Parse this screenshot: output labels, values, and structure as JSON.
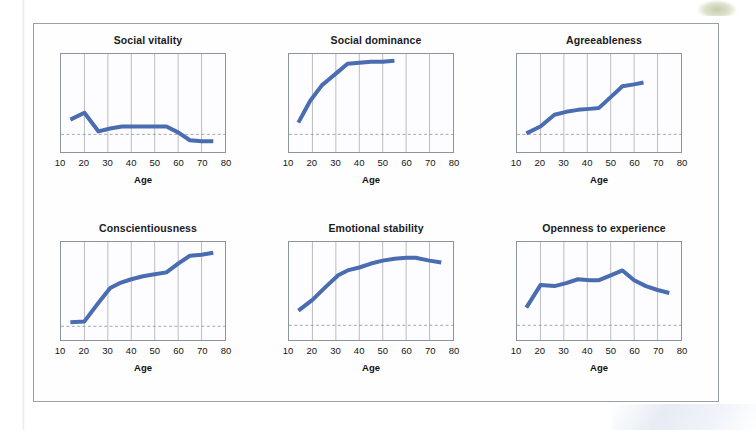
{
  "figure": {
    "x_tick_values": [
      10,
      20,
      30,
      40,
      50,
      60,
      70,
      80
    ],
    "x_axis_label": "Age",
    "line_color": "#4a6cb0",
    "reference_line_color": "#8e949b",
    "grid_color": "#9aa0a6",
    "frame_color": "#9aa0a6"
  },
  "chart_data": [
    {
      "type": "line",
      "title": "Social vitality",
      "xlabel": "Age",
      "ylabel": "",
      "xlim": [
        10,
        80
      ],
      "ylim": [
        0,
        1
      ],
      "xticks": [
        10,
        20,
        30,
        40,
        50,
        60,
        70,
        80
      ],
      "grid": "vertical",
      "reference_line_y": 0.18,
      "x": [
        14,
        20,
        26,
        31,
        36,
        41,
        46,
        51,
        55,
        60,
        65,
        70,
        75
      ],
      "y": [
        0.33,
        0.4,
        0.21,
        0.24,
        0.26,
        0.26,
        0.26,
        0.26,
        0.26,
        0.2,
        0.12,
        0.11,
        0.11
      ]
    },
    {
      "type": "line",
      "title": "Social dominance",
      "xlabel": "Age",
      "ylabel": "",
      "xlim": [
        10,
        80
      ],
      "ylim": [
        0,
        1
      ],
      "xticks": [
        10,
        20,
        30,
        40,
        50,
        60,
        70,
        80
      ],
      "grid": "vertical",
      "reference_line_y": 0.18,
      "x": [
        14,
        19,
        24,
        27,
        31,
        35,
        40,
        45,
        50,
        55
      ],
      "y": [
        0.3,
        0.52,
        0.68,
        0.74,
        0.82,
        0.9,
        0.91,
        0.92,
        0.92,
        0.93
      ]
    },
    {
      "type": "line",
      "title": "Agreeableness",
      "xlabel": "Age",
      "ylabel": "",
      "xlim": [
        10,
        80
      ],
      "ylim": [
        0,
        1
      ],
      "xticks": [
        10,
        20,
        30,
        40,
        50,
        60,
        70,
        80
      ],
      "grid": "vertical",
      "reference_line_y": 0.18,
      "x": [
        14,
        20,
        26,
        31,
        36,
        41,
        45,
        50,
        55,
        60,
        64
      ],
      "y": [
        0.19,
        0.26,
        0.38,
        0.41,
        0.43,
        0.44,
        0.45,
        0.56,
        0.67,
        0.69,
        0.71
      ]
    },
    {
      "type": "line",
      "title": "Conscientiousness",
      "xlabel": "Age",
      "ylabel": "",
      "xlim": [
        10,
        80
      ],
      "ylim": [
        0,
        1
      ],
      "xticks": [
        10,
        20,
        30,
        40,
        50,
        60,
        70,
        80
      ],
      "grid": "vertical",
      "reference_line_y": 0.14,
      "x": [
        14,
        20,
        26,
        31,
        35,
        40,
        45,
        50,
        55,
        60,
        65,
        70,
        75
      ],
      "y": [
        0.18,
        0.19,
        0.38,
        0.53,
        0.58,
        0.62,
        0.65,
        0.67,
        0.69,
        0.78,
        0.86,
        0.87,
        0.89
      ]
    },
    {
      "type": "line",
      "title": "Emotional stability",
      "xlabel": "Age",
      "ylabel": "",
      "xlim": [
        10,
        80
      ],
      "ylim": [
        0,
        1
      ],
      "xticks": [
        10,
        20,
        30,
        40,
        50,
        60,
        70,
        80
      ],
      "grid": "vertical",
      "reference_line_y": 0.15,
      "x": [
        14,
        20,
        26,
        31,
        35,
        40,
        45,
        50,
        55,
        60,
        64,
        70,
        75
      ],
      "y": [
        0.3,
        0.41,
        0.55,
        0.66,
        0.71,
        0.74,
        0.78,
        0.81,
        0.83,
        0.84,
        0.84,
        0.81,
        0.79
      ]
    },
    {
      "type": "line",
      "title": "Openness to experience",
      "xlabel": "Age",
      "ylabel": "",
      "xlim": [
        10,
        80
      ],
      "ylim": [
        0,
        1
      ],
      "xticks": [
        10,
        20,
        30,
        40,
        50,
        60,
        70,
        80
      ],
      "grid": "vertical",
      "reference_line_y": 0.15,
      "x": [
        14,
        20,
        26,
        31,
        36,
        41,
        45,
        50,
        55,
        60,
        65,
        70,
        75
      ],
      "y": [
        0.33,
        0.56,
        0.55,
        0.58,
        0.62,
        0.61,
        0.61,
        0.66,
        0.71,
        0.61,
        0.55,
        0.51,
        0.48
      ]
    }
  ]
}
